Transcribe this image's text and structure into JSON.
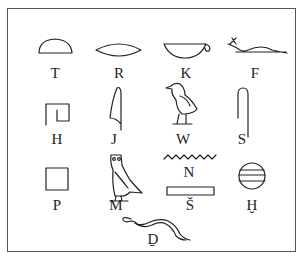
{
  "signs": [
    {
      "glyph": "bread-loaf",
      "label": "T"
    },
    {
      "glyph": "mouth",
      "label": "R"
    },
    {
      "glyph": "basket-with-handle",
      "label": "K"
    },
    {
      "glyph": "horned-viper",
      "label": "F"
    },
    {
      "glyph": "twisted-flax-wick",
      "label": "H"
    },
    {
      "glyph": "cobra-hand",
      "label": "J"
    },
    {
      "glyph": "quail-chick",
      "label": "W"
    },
    {
      "glyph": "folded-cloth",
      "label": "S"
    },
    {
      "glyph": "stool",
      "label": "P"
    },
    {
      "glyph": "owl",
      "label": "M"
    },
    {
      "glyph": "water-ripple",
      "label": "N"
    },
    {
      "glyph": "pool",
      "label": "Š"
    },
    {
      "glyph": "placenta",
      "label": "Ḫ"
    },
    {
      "glyph": "cobra",
      "label": "D̠"
    }
  ],
  "colors": {
    "ink": "#222222",
    "frame": "#555555",
    "background": "#ffffff"
  }
}
